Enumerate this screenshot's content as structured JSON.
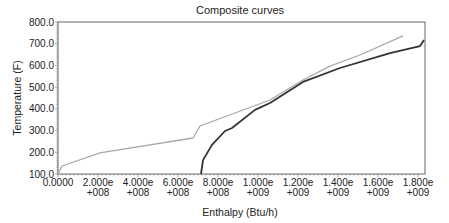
{
  "chart_data": {
    "type": "line",
    "title": "Composite curves",
    "xlabel": "Enthalpy (Btu/h)",
    "ylabel": "Temperature (F)",
    "xlim": [
      0,
      1800000000
    ],
    "ylim": [
      100,
      800
    ],
    "grid": false,
    "legend": null,
    "x_ticks": [
      {
        "value": 0,
        "line1": "0.0000",
        "line2": ""
      },
      {
        "value": 200000000,
        "line1": "2.000e",
        "line2": "+008"
      },
      {
        "value": 400000000,
        "line1": "4.000e",
        "line2": "+008"
      },
      {
        "value": 600000000,
        "line1": "6.000e",
        "line2": "+008"
      },
      {
        "value": 800000000,
        "line1": "8.000e",
        "line2": "+008"
      },
      {
        "value": 1000000000,
        "line1": "1.000e",
        "line2": "+009"
      },
      {
        "value": 1200000000,
        "line1": "1.200e",
        "line2": "+009"
      },
      {
        "value": 1400000000,
        "line1": "1.400e",
        "line2": "+009"
      },
      {
        "value": 1600000000,
        "line1": "1.600e",
        "line2": "+009"
      },
      {
        "value": 1800000000,
        "line1": "1.800e",
        "line2": "+009"
      }
    ],
    "y_ticks": [
      "800.0",
      "700.0",
      "600.0",
      "500.0",
      "400.0",
      "300.0",
      "200.0",
      "100.0"
    ],
    "series": [
      {
        "name": "Hot composite",
        "color": "#a8a8a8",
        "x": [
          0,
          20000000,
          210000000,
          675000000,
          710000000,
          1060000000,
          1225000000,
          1360000000,
          1510000000,
          1725000000
        ],
        "y": [
          100,
          137,
          197,
          266,
          321,
          441,
          533,
          597,
          648,
          736
        ]
      },
      {
        "name": "Cold composite",
        "color": "#333333",
        "x": [
          715000000,
          725000000,
          770000000,
          835000000,
          870000000,
          985000000,
          1060000000,
          1225000000,
          1410000000,
          1660000000,
          1810000000,
          1830000000
        ],
        "y": [
          100,
          164,
          234,
          298,
          312,
          395,
          427,
          524,
          588,
          657,
          689,
          717
        ]
      }
    ]
  }
}
